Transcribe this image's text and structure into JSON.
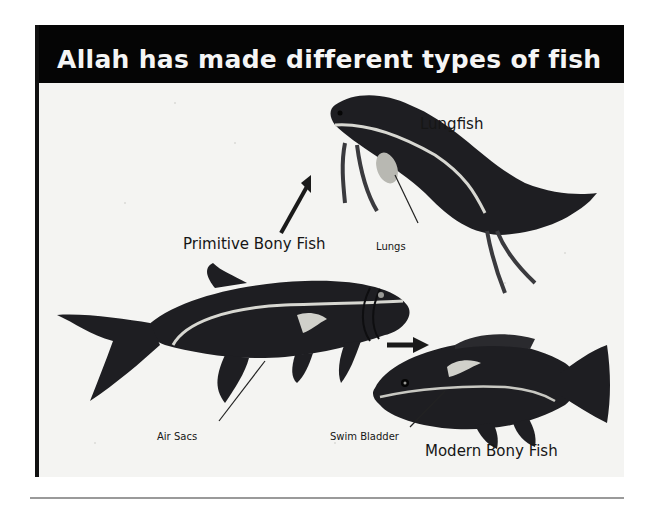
{
  "slide": {
    "title": "Allah has made different types of fish",
    "colors": {
      "title_bar": "#050505",
      "title_text": "#f5f5f5",
      "paper": "#f4f4f2",
      "fish_paint": "#1e1e22",
      "highlight": "#d8d8d2",
      "rule": "#9a9a9a"
    }
  },
  "labels": {
    "lungfish": "Lungfish",
    "primitive_bony_fish": "Primitive Bony Fish",
    "lungs": "Lungs",
    "air_sacs": "Air Sacs",
    "swim_bladder": "Swim Bladder",
    "modern_bony_fish": "Modern Bony Fish"
  },
  "illustration": {
    "fish": [
      "lungfish",
      "primitive-bony-fish",
      "modern-bony-fish"
    ],
    "arrows": [
      "primitive-to-lungfish",
      "primitive-to-modern"
    ]
  }
}
